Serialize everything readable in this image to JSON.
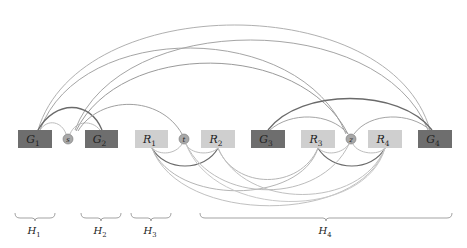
{
  "diagram": {
    "colors": {
      "dark_node": "#6e6e6e",
      "light_node": "#cfcfcf",
      "circle_node": "#a8a8a8",
      "arc_dark": "#6a6a6a",
      "arc_mid": "#999999",
      "arc_light": "#bdbdbd",
      "brace": "#999999",
      "label": "#222222"
    },
    "nodes": [
      {
        "id": "G1",
        "label": "G",
        "sub": "1",
        "kind": "dark",
        "x": 18,
        "y": 130,
        "w": 34,
        "h": 18
      },
      {
        "id": "s",
        "label": "s",
        "kind": "circle",
        "cx": 68,
        "cy": 139,
        "r": 5
      },
      {
        "id": "G2",
        "label": "G",
        "sub": "2",
        "kind": "dark",
        "x": 85,
        "y": 130,
        "w": 33,
        "h": 18
      },
      {
        "id": "R1",
        "label": "R",
        "sub": "1",
        "kind": "light",
        "x": 135,
        "y": 130,
        "w": 33,
        "h": 18
      },
      {
        "id": "t",
        "label": "t",
        "kind": "circle",
        "cx": 184,
        "cy": 139,
        "r": 5
      },
      {
        "id": "R2",
        "label": "R",
        "sub": "2",
        "kind": "light",
        "x": 201,
        "y": 130,
        "w": 34,
        "h": 18
      },
      {
        "id": "G3",
        "label": "G",
        "sub": "3",
        "kind": "dark",
        "x": 251,
        "y": 130,
        "w": 34,
        "h": 18
      },
      {
        "id": "R3",
        "label": "R",
        "sub": "3",
        "kind": "light",
        "x": 301,
        "y": 130,
        "w": 34,
        "h": 18
      },
      {
        "id": "z",
        "label": "z",
        "kind": "circle",
        "cx": 351,
        "cy": 139,
        "r": 5
      },
      {
        "id": "R4",
        "label": "R",
        "sub": "4",
        "kind": "light",
        "x": 368,
        "y": 130,
        "w": 34,
        "h": 18
      },
      {
        "id": "G4",
        "label": "G",
        "sub": "4",
        "kind": "dark",
        "x": 418,
        "y": 130,
        "w": 34,
        "h": 18
      }
    ],
    "groups": [
      {
        "label": "H",
        "sub": "1",
        "x1": 15,
        "x2": 55
      },
      {
        "label": "H",
        "sub": "2",
        "x1": 81,
        "x2": 121
      },
      {
        "label": "H",
        "sub": "3",
        "x1": 131,
        "x2": 171
      },
      {
        "label": "H",
        "sub": "4",
        "x1": 200,
        "x2": 452
      }
    ]
  }
}
